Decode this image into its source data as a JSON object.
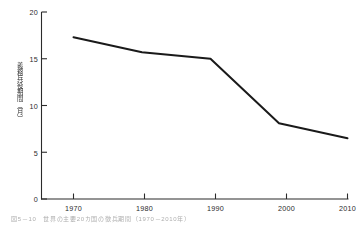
{
  "chart_data": {
    "type": "line",
    "title": "",
    "subtitle": "",
    "xlabel": "",
    "ylabel": "義務兵役期間（月）",
    "x": [
      1970,
      1980,
      1990,
      2000,
      2010
    ],
    "xticklabels": [
      "1970",
      "1980",
      "1990",
      "2000",
      "2010"
    ],
    "xlim": [
      1968,
      2012
    ],
    "yticks": [
      0,
      5,
      10,
      15,
      20
    ],
    "yticklabels": [
      "0",
      "5",
      "10",
      "15",
      "20"
    ],
    "ylim": [
      0,
      20
    ],
    "grid": false,
    "legend": null,
    "series": [
      {
        "name": "義務兵役期間",
        "values": [
          17.3,
          15.7,
          15.0,
          8.1,
          6.5
        ],
        "color": "#1a1a1a",
        "linewidth": 2.0
      }
    ],
    "axis_color": "#2b2b2b",
    "background": "#ffffff"
  },
  "caption": {
    "text": "図5－10　世界の主要20カ国の徴兵期間（1970－2010年）"
  }
}
